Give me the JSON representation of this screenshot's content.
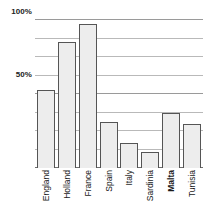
{
  "chart_data": {
    "type": "bar",
    "title": "",
    "xlabel": "",
    "ylabel": "",
    "categories": [
      "England",
      "Holland",
      "France",
      "Spain",
      "Italy",
      "Sardinia",
      "Malta",
      "Tunisia"
    ],
    "values": [
      53,
      85,
      97,
      31,
      17,
      11,
      37,
      30
    ],
    "ylim": [
      0,
      100
    ],
    "ytick_labels": [
      "100%",
      "50%"
    ],
    "ytick_values": [
      100,
      50
    ],
    "gridline_values": [
      100,
      87.5,
      75,
      62.5,
      50,
      37.5,
      25,
      12.5,
      0
    ],
    "grid": true,
    "legend": "none",
    "bar_fill_color": "#ededed",
    "bar_border_color": "#555555",
    "gridline_color": "#b9b9b9",
    "axis_color": "#6e6e6e",
    "emphasized_category": "Malta"
  },
  "axis": {
    "y_top_label": "100%",
    "y_mid_label": "50%"
  }
}
